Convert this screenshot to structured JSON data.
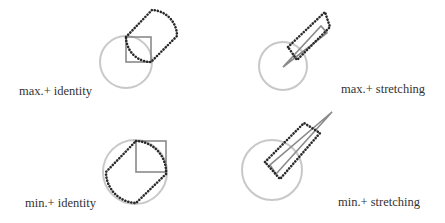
{
  "figure": {
    "panels": [
      {
        "id": "max-identity",
        "label": "max.+ identity",
        "reference_shape": "square",
        "result_shape": "dotted capsule (two quarter-arcs joined by straight segments)"
      },
      {
        "id": "max-stretching",
        "label": "max.+ stretching",
        "reference_shape": "thin triangle",
        "result_shape": "dotted elongated rectangle"
      },
      {
        "id": "min-identity",
        "label": "min.+ identity",
        "reference_shape": "square",
        "result_shape": "dotted rounded shape following circle"
      },
      {
        "id": "min-stretching",
        "label": "min.+ stretching",
        "reference_shape": "thin triangle",
        "result_shape": "dotted elongated rectangle"
      }
    ],
    "colors": {
      "circle": "#c8c8c8",
      "reference_shape": "#8a8a8a",
      "dotted_result": "#2a2a2a",
      "text": "#333333"
    }
  }
}
